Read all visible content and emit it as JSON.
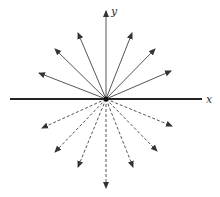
{
  "diagram": {
    "center": [
      106,
      99
    ],
    "axes": {
      "x": {
        "label": "x",
        "from": [
          10,
          99
        ],
        "to": [
          202,
          99
        ],
        "label_pos": [
          206,
          103
        ]
      },
      "y": {
        "label": "y",
        "from": [
          106,
          99
        ],
        "to": [
          106,
          11
        ],
        "label_pos": [
          111,
          15
        ]
      }
    },
    "solid_arrows": [
      [
        39,
        73
      ],
      [
        55,
        49
      ],
      [
        78,
        33
      ],
      [
        132,
        33
      ],
      [
        155,
        49
      ],
      [
        171,
        71
      ]
    ],
    "dashed_arrows": [
      [
        42,
        128
      ],
      [
        55,
        152
      ],
      [
        78,
        167
      ],
      [
        106,
        188
      ],
      [
        133,
        167
      ],
      [
        157,
        151
      ],
      [
        172,
        126
      ]
    ],
    "colors": {
      "line": "#555555",
      "axis": "#222222"
    }
  }
}
